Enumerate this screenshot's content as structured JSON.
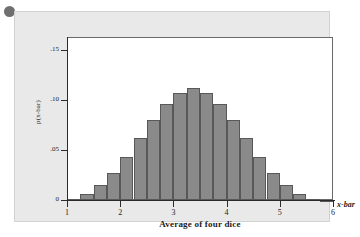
{
  "figure": {
    "bullet_marker": "•"
  },
  "chart_data": {
    "type": "bar",
    "title": "",
    "subtitle": "",
    "xlabel": "Average of four dice",
    "ylabel": "p(x-bar)",
    "x_variable_label": "x-bar",
    "grid": false,
    "legend": "none",
    "xlim": [
      1.0,
      6.0
    ],
    "ylim": [
      0,
      0.163
    ],
    "x_tick_labels": [
      "1",
      "2",
      "3",
      "4",
      "5",
      "6"
    ],
    "x_tick_values": [
      1,
      2,
      3,
      4,
      5,
      6
    ],
    "y_tick_labels": [
      "0",
      ".05",
      ".10",
      ".15"
    ],
    "y_tick_values": [
      0,
      0.05,
      0.1,
      0.15
    ],
    "bar_width": 0.25,
    "bar_fill_color": "#8a8a8a",
    "bar_edge_color": "#585858",
    "categories": [
      "1.00",
      "1.25",
      "1.50",
      "1.75",
      "2.00",
      "2.25",
      "2.50",
      "2.75",
      "3.00",
      "3.25",
      "3.50",
      "3.75",
      "4.00",
      "4.25",
      "4.50",
      "4.75",
      "5.00",
      "5.25",
      "5.50",
      "5.75"
    ],
    "values": [
      0.001,
      0.006,
      0.015,
      0.027,
      0.043,
      0.062,
      0.08,
      0.096,
      0.107,
      0.112,
      0.107,
      0.096,
      0.08,
      0.062,
      0.043,
      0.027,
      0.015,
      0.006,
      0.001,
      0.0005
    ]
  },
  "colors": {
    "card_background": "#e9e9e9",
    "panel_background": "#ffffff",
    "axis": "#2b2b2b",
    "bar_fill": "#8a8a8a",
    "bar_edge": "#585858"
  }
}
